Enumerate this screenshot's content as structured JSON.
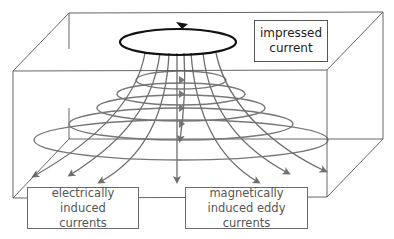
{
  "diagram": {
    "labels": {
      "impressed_current": [
        "impressed",
        "current"
      ],
      "electrically_induced": [
        "electrically induced",
        "currents"
      ],
      "magnetically_induced": [
        "magnetically",
        "induced eddy currents"
      ]
    },
    "nodes": [
      {
        "id": "impressed-current-loop",
        "label": "impressed current",
        "shape": "ellipse",
        "direction": "counter-clockwise arrow at top"
      },
      {
        "id": "induced-rings",
        "label": "magnetically induced eddy currents",
        "shape": "concentric ellipses",
        "count": 5
      },
      {
        "id": "field-lines",
        "label": "electrically induced currents",
        "shape": "curved arrows",
        "count": 9
      }
    ],
    "colors": {
      "loop": "#111111",
      "lines": "#6e6e6e",
      "box": "#555555",
      "text": "#555555"
    }
  }
}
